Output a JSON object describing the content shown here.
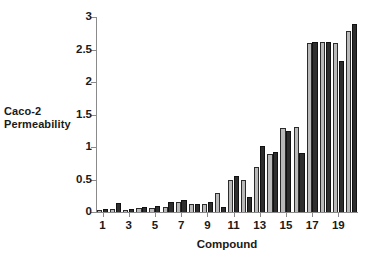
{
  "chart_data": {
    "type": "bar",
    "title": "",
    "xlabel": "Compound",
    "ylabel": "Caco-2 Permeability",
    "ylabel_lines": [
      "Caco-2",
      "Permeability"
    ],
    "categories": [
      1,
      2,
      3,
      4,
      5,
      6,
      7,
      8,
      9,
      10,
      11,
      12,
      13,
      14,
      15,
      16,
      17,
      18,
      19,
      20
    ],
    "xtick_labels": [
      "1",
      "3",
      "5",
      "7",
      "9",
      "11",
      "13",
      "15",
      "17",
      "19"
    ],
    "xtick_categories": [
      1,
      3,
      5,
      7,
      9,
      11,
      13,
      15,
      17,
      19
    ],
    "ytick_labels": [
      "0",
      "0.5",
      "1",
      "1.5",
      "2",
      "2.5",
      "3"
    ],
    "ytick_values": [
      0,
      0.5,
      1,
      1.5,
      2,
      2.5,
      3
    ],
    "ylim": [
      0,
      3
    ],
    "grid": false,
    "legend": "none",
    "series": [
      {
        "name": "light",
        "color": "#b9b9b9",
        "values": [
          0.02,
          0.04,
          0.02,
          0.06,
          0.06,
          0.07,
          0.15,
          0.12,
          0.13,
          0.3,
          0.49,
          0.5,
          0.69,
          0.9,
          1.3,
          1.31,
          2.6,
          2.61,
          2.6,
          2.79
        ]
      },
      {
        "name": "dark",
        "color": "#2e2e2e",
        "values": [
          0.04,
          0.14,
          0.04,
          0.07,
          0.1,
          0.16,
          0.19,
          0.13,
          0.15,
          0.07,
          0.55,
          0.23,
          1.01,
          0.92,
          1.25,
          0.91,
          2.61,
          2.62,
          2.33,
          2.9
        ]
      }
    ]
  },
  "axes": {
    "y_title_line1": "Caco-2",
    "y_title_line2": "Permeability",
    "x_title": "Compound"
  }
}
